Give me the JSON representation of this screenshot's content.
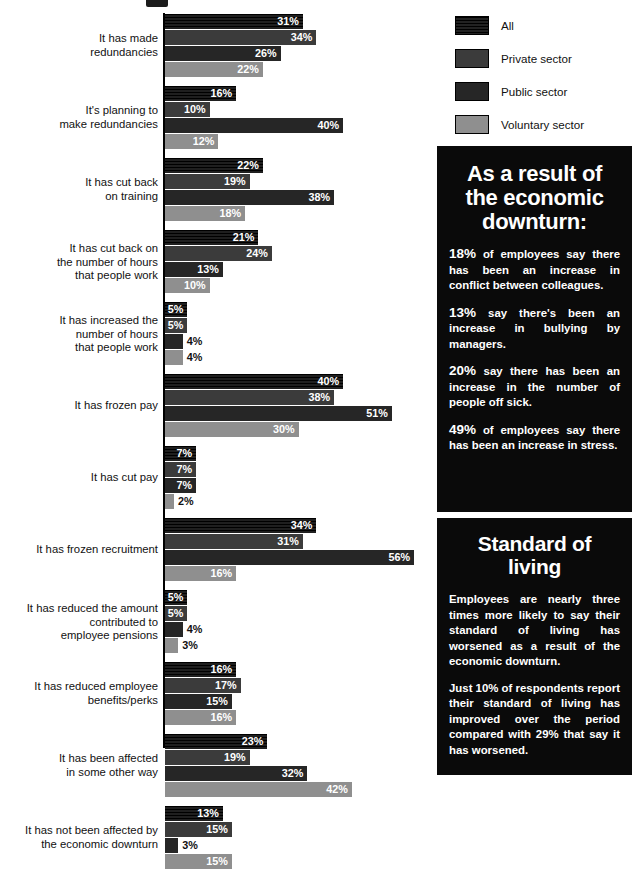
{
  "legend": {
    "items": [
      {
        "label": "All",
        "shade": "#0d0d0d"
      },
      {
        "label": "Private sector",
        "shade": "#3b3b3b"
      },
      {
        "label": "Public sector",
        "shade": "#262626"
      },
      {
        "label": "Voluntary sector",
        "shade": "#8f8f8f"
      }
    ]
  },
  "chart_data": {
    "type": "bar",
    "orientation": "horizontal",
    "title": "",
    "xlabel": "",
    "ylabel": "",
    "xlim": [
      0,
      60
    ],
    "grid": false,
    "legend_position": "top-right",
    "value_suffix": "%",
    "categories": [
      "It has made redundancies",
      "It's planning to make redundancies",
      "It has cut back on training",
      "It has cut back on the number of hours that people work",
      "It has increased the number of hours that people work",
      "It has frozen pay",
      "It has cut pay",
      "It has frozen recruitment",
      "It has reduced the amount contributed to employee pensions",
      "It has reduced employee benefits/perks",
      "It has been affected in some other way",
      "It has not been affected by the economic downturn"
    ],
    "series": [
      {
        "name": "All",
        "values": [
          31,
          16,
          22,
          21,
          5,
          40,
          7,
          34,
          5,
          16,
          23,
          13
        ]
      },
      {
        "name": "Private sector",
        "values": [
          34,
          10,
          19,
          24,
          5,
          38,
          7,
          31,
          5,
          17,
          19,
          15
        ]
      },
      {
        "name": "Public sector",
        "values": [
          26,
          40,
          38,
          13,
          4,
          51,
          7,
          56,
          4,
          15,
          32,
          3
        ]
      },
      {
        "name": "Voluntary sector",
        "values": [
          22,
          12,
          18,
          10,
          4,
          30,
          2,
          16,
          3,
          16,
          42,
          15
        ]
      }
    ]
  },
  "groups": [
    {
      "label_lines": [
        "It has made",
        "redundancies"
      ],
      "bars": [
        {
          "value": 31,
          "text": "31%",
          "shade": 0
        },
        {
          "value": 34,
          "text": "34%",
          "shade": 1
        },
        {
          "value": 26,
          "text": "26%",
          "shade": 2
        },
        {
          "value": 22,
          "text": "22%",
          "shade": 3
        }
      ]
    },
    {
      "label_lines": [
        "It's planning to",
        "make redundancies"
      ],
      "bars": [
        {
          "value": 16,
          "text": "16%",
          "shade": 0
        },
        {
          "value": 10,
          "text": "10%",
          "shade": 1
        },
        {
          "value": 40,
          "text": "40%",
          "shade": 2
        },
        {
          "value": 12,
          "text": "12%",
          "shade": 3
        }
      ]
    },
    {
      "label_lines": [
        "It has cut back",
        "on training"
      ],
      "bars": [
        {
          "value": 22,
          "text": "22%",
          "shade": 0
        },
        {
          "value": 19,
          "text": "19%",
          "shade": 1
        },
        {
          "value": 38,
          "text": "38%",
          "shade": 2
        },
        {
          "value": 18,
          "text": "18%",
          "shade": 3
        }
      ]
    },
    {
      "label_lines": [
        "It has cut back on",
        "the number of hours",
        "that people work"
      ],
      "bars": [
        {
          "value": 21,
          "text": "21%",
          "shade": 0
        },
        {
          "value": 24,
          "text": "24%",
          "shade": 1
        },
        {
          "value": 13,
          "text": "13%",
          "shade": 2
        },
        {
          "value": 10,
          "text": "10%",
          "shade": 3
        }
      ]
    },
    {
      "label_lines": [
        "It has increased the",
        "number of hours",
        "that people work"
      ],
      "bars": [
        {
          "value": 5,
          "text": "5%",
          "shade": 0
        },
        {
          "value": 5,
          "text": "5%",
          "shade": 1
        },
        {
          "value": 4,
          "text": "4%",
          "shade": 2
        },
        {
          "value": 4,
          "text": "4%",
          "shade": 3
        }
      ]
    },
    {
      "label_lines": [
        "It has frozen pay"
      ],
      "bars": [
        {
          "value": 40,
          "text": "40%",
          "shade": 0
        },
        {
          "value": 38,
          "text": "38%",
          "shade": 1
        },
        {
          "value": 51,
          "text": "51%",
          "shade": 2
        },
        {
          "value": 30,
          "text": "30%",
          "shade": 3
        }
      ]
    },
    {
      "label_lines": [
        "It has cut pay"
      ],
      "bars": [
        {
          "value": 7,
          "text": "7%",
          "shade": 0
        },
        {
          "value": 7,
          "text": "7%",
          "shade": 1
        },
        {
          "value": 7,
          "text": "7%",
          "shade": 2
        },
        {
          "value": 2,
          "text": "2%",
          "shade": 3
        }
      ]
    },
    {
      "label_lines": [
        "It has frozen recruitment"
      ],
      "bars": [
        {
          "value": 34,
          "text": "34%",
          "shade": 0
        },
        {
          "value": 31,
          "text": "31%",
          "shade": 1
        },
        {
          "value": 56,
          "text": "56%",
          "shade": 2
        },
        {
          "value": 16,
          "text": "16%",
          "shade": 3
        }
      ]
    },
    {
      "label_lines": [
        "It has reduced the amount",
        "contributed to",
        "employee pensions"
      ],
      "bars": [
        {
          "value": 5,
          "text": "5%",
          "shade": 0
        },
        {
          "value": 5,
          "text": "5%",
          "shade": 1
        },
        {
          "value": 4,
          "text": "4%",
          "shade": 2
        },
        {
          "value": 3,
          "text": "3%",
          "shade": 3
        }
      ]
    },
    {
      "label_lines": [
        "It has reduced employee",
        "benefits/perks"
      ],
      "bars": [
        {
          "value": 16,
          "text": "16%",
          "shade": 0
        },
        {
          "value": 17,
          "text": "17%",
          "shade": 1
        },
        {
          "value": 15,
          "text": "15%",
          "shade": 2
        },
        {
          "value": 16,
          "text": "16%",
          "shade": 3
        }
      ]
    },
    {
      "label_lines": [
        "It has been affected",
        "in some other way"
      ],
      "bars": [
        {
          "value": 23,
          "text": "23%",
          "shade": 0
        },
        {
          "value": 19,
          "text": "19%",
          "shade": 1
        },
        {
          "value": 32,
          "text": "32%",
          "shade": 2
        },
        {
          "value": 42,
          "text": "42%",
          "shade": 3
        }
      ]
    },
    {
      "label_lines": [
        "It has not been affected by",
        "the economic downturn"
      ],
      "bars": [
        {
          "value": 13,
          "text": "13%",
          "shade": 0
        },
        {
          "value": 15,
          "text": "15%",
          "shade": 1
        },
        {
          "value": 3,
          "text": "3%",
          "shade": 2
        },
        {
          "value": 15,
          "text": "15%",
          "shade": 3
        }
      ]
    }
  ],
  "info_boxes": [
    {
      "title": "As a result of the economic downturn:",
      "paragraphs": [
        {
          "pct": "18%",
          "rest": " of employees say there has been an increase in conflict between colleagues."
        },
        {
          "pct": "13%",
          "rest": " say there's been an increase in bullying by managers."
        },
        {
          "pct": "20%",
          "rest": " say there has been an increase in the number of people off sick."
        },
        {
          "pct": "49%",
          "rest": " of employees say there has been an increase in stress."
        }
      ]
    },
    {
      "title": "Standard of living",
      "paragraphs": [
        {
          "pct": "",
          "rest": "Employees are nearly three times more likely to say their standard of living has worsened as a result of the economic downturn."
        },
        {
          "pct": "",
          "rest": "Just 10% of respondents report their standard of living has improved over the period compared with 29% that say it has worsened."
        }
      ]
    }
  ]
}
